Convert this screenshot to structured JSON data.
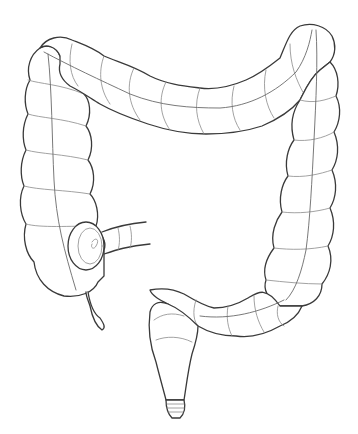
{
  "illustration": {
    "subject": "large intestine line drawing",
    "colors": {
      "background": "#ffffff",
      "outline": "#3a3a3a",
      "detail": "#8a8a8a"
    },
    "parts": [
      "cecum",
      "appendix",
      "ileum",
      "ascending-colon",
      "transverse-colon",
      "descending-colon",
      "sigmoid-colon",
      "rectum",
      "anus"
    ]
  }
}
